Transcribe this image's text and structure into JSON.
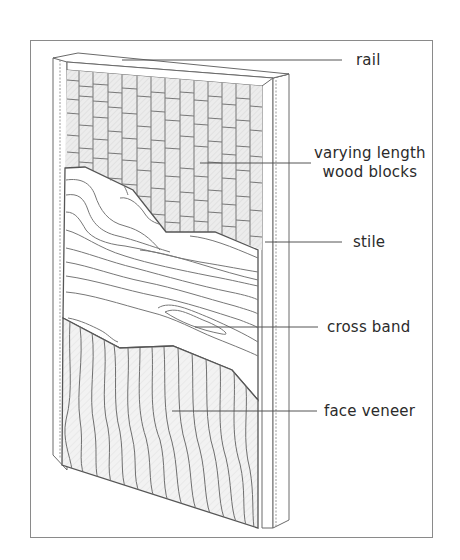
{
  "figure": {
    "colors": {
      "border": "#8a8a8a",
      "line": "#6a6a6a",
      "block_fill": "#e6e6e6",
      "veneer_fill": "#efefef",
      "crossband_fill": "#ffffff",
      "text": "#2b2b2b"
    },
    "labels": {
      "rail": "rail",
      "blocks_line1": "varying length",
      "blocks_line2": "wood blocks",
      "stile": "stile",
      "cross_band": "cross band",
      "face_veneer": "face veneer"
    },
    "components": [
      {
        "id": "rail",
        "label": "rail"
      },
      {
        "id": "core",
        "label": "varying length wood blocks"
      },
      {
        "id": "stile",
        "label": "stile"
      },
      {
        "id": "cross_band",
        "label": "cross band"
      },
      {
        "id": "face_veneer",
        "label": "face veneer"
      }
    ]
  }
}
